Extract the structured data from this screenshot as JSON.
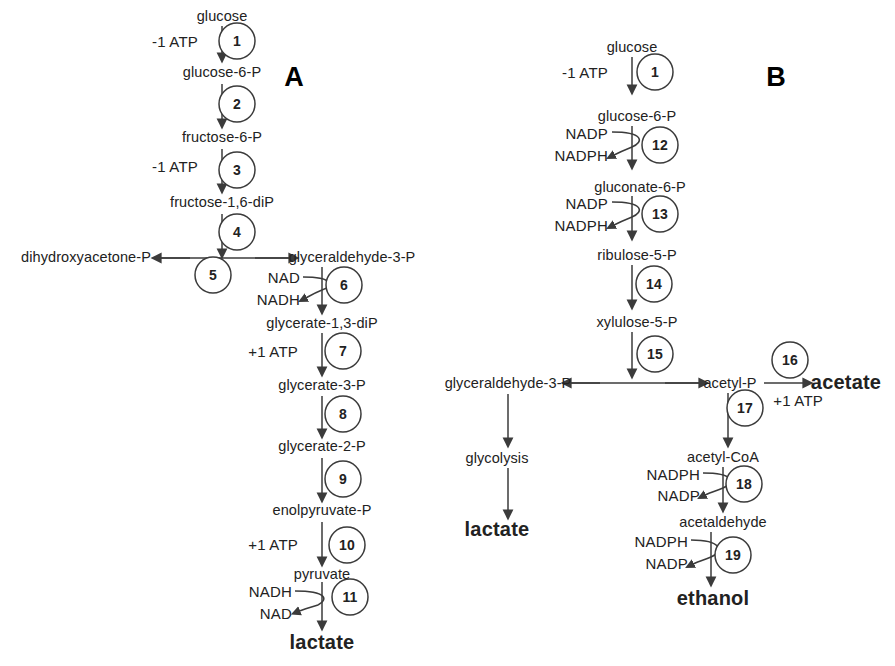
{
  "figure": {
    "background": "#ffffff",
    "stroke": "#3b3b3b",
    "text_color": "#222222"
  },
  "panels": [
    {
      "id": "A",
      "letter": "A"
    },
    {
      "id": "B",
      "letter": "B"
    }
  ],
  "panelA": {
    "letter": "A",
    "metabolites": [
      {
        "name": "glucose",
        "x": 222,
        "y": 16,
        "anchor": "c",
        "bold": false
      },
      {
        "name": "glucose-6-P",
        "x": 222,
        "y": 72,
        "anchor": "c",
        "bold": false
      },
      {
        "name": "fructose-6-P",
        "x": 222,
        "y": 137,
        "anchor": "c",
        "bold": false
      },
      {
        "name": "fructose-1,6-diP",
        "x": 222,
        "y": 202,
        "anchor": "c",
        "bold": false
      },
      {
        "name": "dihydroxyacetone-P",
        "x": 86,
        "y": 257,
        "anchor": "c",
        "bold": false
      },
      {
        "name": "glyceraldehyde-3-P",
        "x": 350,
        "y": 257,
        "anchor": "c",
        "bold": false
      },
      {
        "name": "glycerate-1,3-diP",
        "x": 322,
        "y": 323,
        "anchor": "c",
        "bold": false
      },
      {
        "name": "glycerate-3-P",
        "x": 322,
        "y": 385,
        "anchor": "c",
        "bold": false
      },
      {
        "name": "glycerate-2-P",
        "x": 322,
        "y": 446,
        "anchor": "c",
        "bold": false
      },
      {
        "name": "enolpyruvate-P",
        "x": 322,
        "y": 510,
        "anchor": "c",
        "bold": false
      },
      {
        "name": "pyruvate",
        "x": 322,
        "y": 574,
        "anchor": "c",
        "bold": false
      },
      {
        "name": "lactate",
        "x": 322,
        "y": 644,
        "anchor": "c",
        "bold": true
      }
    ],
    "cofactors": [
      {
        "name": "-1 ATP",
        "x": 198,
        "y": 41,
        "anchor": "r"
      },
      {
        "name": "-1 ATP",
        "x": 198,
        "y": 166,
        "anchor": "r"
      },
      {
        "name": "NAD",
        "x": 300,
        "y": 281,
        "anchor": "r"
      },
      {
        "name": "NADH",
        "x": 300,
        "y": 302,
        "anchor": "r"
      },
      {
        "name": "+1 ATP",
        "x": 298,
        "y": 352,
        "anchor": "r"
      },
      {
        "name": "+1 ATP",
        "x": 298,
        "y": 543,
        "anchor": "r"
      },
      {
        "name": "NADH",
        "x": 292,
        "y": 594,
        "anchor": "r"
      },
      {
        "name": "NAD",
        "x": 292,
        "y": 615,
        "anchor": "r"
      }
    ],
    "steps": [
      {
        "n": "1",
        "cx": 237,
        "cy": 41
      },
      {
        "n": "2",
        "cx": 237,
        "cy": 104
      },
      {
        "n": "3",
        "cx": 237,
        "cy": 170
      },
      {
        "n": "4",
        "cx": 237,
        "cy": 232
      },
      {
        "n": "5",
        "cx": 213,
        "cy": 275
      },
      {
        "n": "6",
        "cx": 344,
        "cy": 285
      },
      {
        "n": "7",
        "cx": 343,
        "cy": 351
      },
      {
        "n": "8",
        "cx": 343,
        "cy": 414
      },
      {
        "n": "9",
        "cx": 343,
        "cy": 479
      },
      {
        "n": "10",
        "cx": 347,
        "cy": 545
      },
      {
        "n": "11",
        "cx": 350,
        "cy": 597
      }
    ]
  },
  "panelB": {
    "letter": "B",
    "metabolites": [
      {
        "name": "glucose",
        "x": 632,
        "y": 47,
        "anchor": "c",
        "bold": false
      },
      {
        "name": "glucose-6-P",
        "x": 637,
        "y": 116,
        "anchor": "c",
        "bold": false
      },
      {
        "name": "gluconate-6-P",
        "x": 640,
        "y": 187,
        "anchor": "c",
        "bold": false
      },
      {
        "name": "ribulose-5-P",
        "x": 637,
        "y": 255,
        "anchor": "c",
        "bold": false
      },
      {
        "name": "xylulose-5-P",
        "x": 637,
        "y": 322,
        "anchor": "c",
        "bold": false
      },
      {
        "name": "glyceraldehyde-3-P",
        "x": 508,
        "y": 383,
        "anchor": "c",
        "bold": false
      },
      {
        "name": "acetyl-P",
        "x": 728,
        "y": 383,
        "anchor": "c",
        "bold": false
      },
      {
        "name": "acetate",
        "x": 845,
        "y": 383,
        "anchor": "c",
        "bold": true
      },
      {
        "name": "glycolysis",
        "x": 497,
        "y": 458,
        "anchor": "c",
        "bold": false
      },
      {
        "name": "lactate",
        "x": 497,
        "y": 531,
        "anchor": "c",
        "bold": true
      },
      {
        "name": "acetyl-CoA",
        "x": 723,
        "y": 457,
        "anchor": "c",
        "bold": false
      },
      {
        "name": "acetaldehyde",
        "x": 723,
        "y": 522,
        "anchor": "c",
        "bold": false
      },
      {
        "name": "ethanol",
        "x": 711,
        "y": 600,
        "anchor": "c",
        "bold": true
      }
    ],
    "cofactors": [
      {
        "name": "-1 ATP",
        "x": 608,
        "y": 72,
        "anchor": "r"
      },
      {
        "name": "NADP",
        "x": 608,
        "y": 136,
        "anchor": "r"
      },
      {
        "name": "NADPH",
        "x": 608,
        "y": 158,
        "anchor": "r"
      },
      {
        "name": "NADP",
        "x": 608,
        "y": 206,
        "anchor": "r"
      },
      {
        "name": "NADPH",
        "x": 608,
        "y": 228,
        "anchor": "r"
      },
      {
        "name": "+1 ATP",
        "x": 823,
        "y": 400,
        "anchor": "r"
      },
      {
        "name": "NADPH",
        "x": 700,
        "y": 477,
        "anchor": "r"
      },
      {
        "name": "NADP",
        "x": 700,
        "y": 497,
        "anchor": "r"
      },
      {
        "name": "NADPH",
        "x": 688,
        "y": 543,
        "anchor": "r"
      },
      {
        "name": "NADP",
        "x": 688,
        "y": 565,
        "anchor": "r"
      }
    ],
    "steps": [
      {
        "n": "12",
        "cx": 660,
        "cy": 145
      },
      {
        "n": "13",
        "cx": 660,
        "cy": 214
      },
      {
        "n": "14",
        "cx": 654,
        "cy": 284
      },
      {
        "n": "15",
        "cx": 655,
        "cy": 354
      },
      {
        "n": "16",
        "cx": 790,
        "cy": 360
      },
      {
        "n": "17",
        "cx": 745,
        "cy": 408
      },
      {
        "n": "18",
        "cx": 744,
        "cy": 484
      },
      {
        "n": "1",
        "cx": 655,
        "cy": 72
      },
      {
        "n": "19",
        "cx": 733,
        "cy": 555
      }
    ]
  }
}
